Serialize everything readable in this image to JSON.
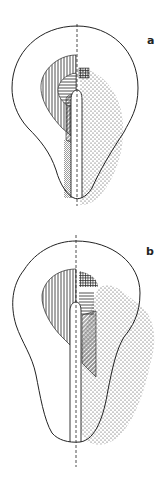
{
  "figure": {
    "panels": [
      {
        "id": "a",
        "label": "a"
      },
      {
        "id": "b",
        "label": "b"
      }
    ]
  },
  "colors": {
    "ink": "#222222",
    "background": "#ffffff"
  },
  "patterns": [
    "vertical-hatching",
    "horizontal-hatching",
    "cross-hatching",
    "diagonal-hatching",
    "dense-stipple",
    "sparse-stipple"
  ]
}
